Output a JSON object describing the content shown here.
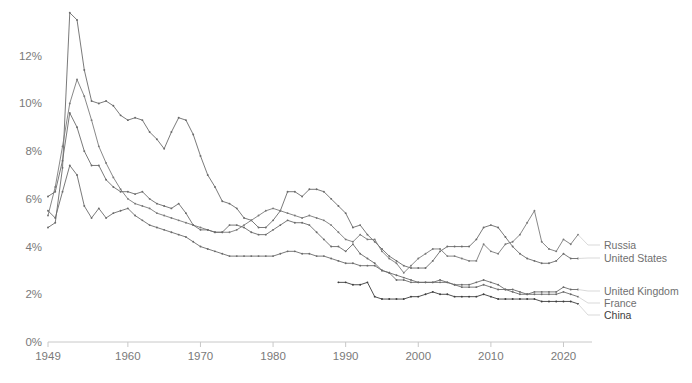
{
  "chart_data": {
    "type": "line",
    "title": "",
    "subtitle": "",
    "xlabel": "",
    "ylabel": "",
    "xlim": [
      1949,
      2022
    ],
    "ylim": [
      0,
      14
    ],
    "grid": false,
    "legend_position": "right-inline",
    "y_ticks": [
      "0%",
      "2%",
      "4%",
      "6%",
      "8%",
      "10%",
      "12%"
    ],
    "y_tick_values": [
      0,
      2,
      4,
      6,
      8,
      10,
      12
    ],
    "x_ticks": [
      "1949",
      "1960",
      "1970",
      "1980",
      "1990",
      "2000",
      "2010",
      "2020"
    ],
    "x_tick_values": [
      1949,
      1960,
      1970,
      1980,
      1990,
      2000,
      2010,
      2020
    ],
    "value_unit": "percent",
    "series": [
      {
        "name": "United States",
        "color": "#6b6b6b",
        "x": [
          1949,
          1950,
          1951,
          1952,
          1953,
          1954,
          1955,
          1956,
          1957,
          1958,
          1959,
          1960,
          1961,
          1962,
          1963,
          1964,
          1965,
          1966,
          1967,
          1968,
          1969,
          1970,
          1971,
          1972,
          1973,
          1974,
          1975,
          1976,
          1977,
          1978,
          1979,
          1980,
          1981,
          1982,
          1983,
          1984,
          1985,
          1986,
          1987,
          1988,
          1989,
          1990,
          1991,
          1992,
          1993,
          1994,
          1995,
          1996,
          1997,
          1998,
          1999,
          2000,
          2001,
          2002,
          2003,
          2004,
          2005,
          2006,
          2007,
          2008,
          2009,
          2010,
          2011,
          2012,
          2013,
          2014,
          2015,
          2016,
          2017,
          2018,
          2019,
          2020,
          2021,
          2022
        ],
        "values": [
          4.8,
          5.0,
          7.3,
          13.8,
          13.5,
          11.4,
          10.1,
          10.0,
          10.1,
          9.9,
          9.5,
          9.3,
          9.4,
          9.3,
          8.8,
          8.5,
          8.1,
          8.8,
          9.4,
          9.3,
          8.7,
          7.8,
          7.0,
          6.5,
          5.9,
          5.8,
          5.6,
          5.2,
          5.1,
          4.8,
          4.8,
          5.1,
          5.5,
          6.3,
          6.3,
          6.1,
          6.4,
          6.4,
          6.3,
          6.0,
          5.7,
          5.4,
          4.8,
          4.9,
          4.5,
          4.2,
          3.9,
          3.6,
          3.4,
          3.2,
          3.1,
          3.1,
          3.1,
          3.4,
          3.8,
          4.0,
          4.0,
          4.0,
          4.0,
          4.3,
          4.8,
          4.9,
          4.8,
          4.4,
          4.0,
          3.7,
          3.5,
          3.4,
          3.3,
          3.3,
          3.4,
          3.7,
          3.5,
          3.5
        ]
      },
      {
        "name": "Russia",
        "color": "#7a7a7a",
        "x": [
          1949,
          1950,
          1951,
          1952,
          1953,
          1954,
          1955,
          1956,
          1957,
          1958,
          1959,
          1960,
          1961,
          1962,
          1963,
          1964,
          1965,
          1966,
          1967,
          1968,
          1969,
          1970,
          1971,
          1972,
          1973,
          1974,
          1975,
          1976,
          1977,
          1978,
          1979,
          1980,
          1981,
          1982,
          1983,
          1984,
          1985,
          1986,
          1987,
          1988,
          1989,
          1990,
          1991,
          1992,
          1993,
          1994,
          1995,
          1996,
          1997,
          1998,
          1999,
          2000,
          2001,
          2002,
          2003,
          2004,
          2005,
          2006,
          2007,
          2008,
          2009,
          2010,
          2011,
          2012,
          2013,
          2014,
          2015,
          2016,
          2017,
          2018,
          2019,
          2020,
          2021,
          2022
        ],
        "values": [
          5.3,
          6.5,
          8.2,
          10.0,
          11.0,
          10.3,
          9.3,
          8.2,
          7.5,
          6.9,
          6.4,
          6.0,
          5.8,
          5.7,
          5.6,
          5.4,
          5.3,
          5.2,
          5.1,
          5.0,
          4.9,
          4.8,
          4.7,
          4.6,
          4.6,
          4.6,
          4.7,
          4.9,
          5.1,
          5.3,
          5.5,
          5.6,
          5.5,
          5.4,
          5.3,
          5.2,
          5.3,
          5.2,
          5.1,
          4.9,
          4.6,
          4.3,
          4.2,
          4.5,
          4.3,
          4.3,
          3.8,
          3.5,
          3.3,
          2.9,
          3.2,
          3.5,
          3.7,
          3.9,
          3.9,
          3.6,
          3.6,
          3.5,
          3.4,
          3.4,
          4.1,
          3.8,
          3.7,
          4.1,
          4.2,
          4.5,
          5.0,
          5.5,
          4.2,
          3.9,
          3.8,
          4.3,
          4.1,
          4.5
        ]
      },
      {
        "name": "United Kingdom",
        "color": "#6b6b6b",
        "x": [
          1949,
          1950,
          1951,
          1952,
          1953,
          1954,
          1955,
          1956,
          1957,
          1958,
          1959,
          1960,
          1961,
          1962,
          1963,
          1964,
          1965,
          1966,
          1967,
          1968,
          1969,
          1970,
          1971,
          1972,
          1973,
          1974,
          1975,
          1976,
          1977,
          1978,
          1979,
          1980,
          1981,
          1982,
          1983,
          1984,
          1985,
          1986,
          1987,
          1988,
          1989,
          1990,
          1991,
          1992,
          1993,
          1994,
          1995,
          1996,
          1997,
          1998,
          1999,
          2000,
          2001,
          2002,
          2003,
          2004,
          2005,
          2006,
          2007,
          2008,
          2009,
          2010,
          2011,
          2012,
          2013,
          2014,
          2015,
          2016,
          2017,
          2018,
          2019,
          2020,
          2021,
          2022
        ],
        "values": [
          6.1,
          6.3,
          7.6,
          9.6,
          9.0,
          8.0,
          7.4,
          7.4,
          6.8,
          6.5,
          6.3,
          6.3,
          6.2,
          6.3,
          6.0,
          5.8,
          5.7,
          5.6,
          5.8,
          5.4,
          4.9,
          4.7,
          4.7,
          4.6,
          4.6,
          4.9,
          4.9,
          4.8,
          4.6,
          4.5,
          4.5,
          4.7,
          4.9,
          5.1,
          5.0,
          5.0,
          4.9,
          4.6,
          4.3,
          4.0,
          4.0,
          3.8,
          4.1,
          3.7,
          3.5,
          3.3,
          3.0,
          2.9,
          2.6,
          2.6,
          2.5,
          2.5,
          2.5,
          2.5,
          2.6,
          2.5,
          2.4,
          2.4,
          2.4,
          2.5,
          2.6,
          2.5,
          2.4,
          2.2,
          2.2,
          2.1,
          2.0,
          2.1,
          2.1,
          2.1,
          2.1,
          2.3,
          2.2,
          2.2
        ]
      },
      {
        "name": "France",
        "color": "#6b6b6b",
        "x": [
          1949,
          1950,
          1951,
          1952,
          1953,
          1954,
          1955,
          1956,
          1957,
          1958,
          1959,
          1960,
          1961,
          1962,
          1963,
          1964,
          1965,
          1966,
          1967,
          1968,
          1969,
          1970,
          1971,
          1972,
          1973,
          1974,
          1975,
          1976,
          1977,
          1978,
          1979,
          1980,
          1981,
          1982,
          1983,
          1984,
          1985,
          1986,
          1987,
          1988,
          1989,
          1990,
          1991,
          1992,
          1993,
          1994,
          1995,
          1996,
          1997,
          1998,
          1999,
          2000,
          2001,
          2002,
          2003,
          2004,
          2005,
          2006,
          2007,
          2008,
          2009,
          2010,
          2011,
          2012,
          2013,
          2014,
          2015,
          2016,
          2017,
          2018,
          2019,
          2020,
          2021,
          2022
        ],
        "values": [
          5.5,
          5.2,
          6.3,
          7.4,
          7.0,
          5.7,
          5.2,
          5.6,
          5.2,
          5.4,
          5.5,
          5.6,
          5.3,
          5.1,
          4.9,
          4.8,
          4.7,
          4.6,
          4.5,
          4.4,
          4.2,
          4.0,
          3.9,
          3.8,
          3.7,
          3.6,
          3.6,
          3.6,
          3.6,
          3.6,
          3.6,
          3.6,
          3.7,
          3.8,
          3.8,
          3.7,
          3.7,
          3.6,
          3.6,
          3.5,
          3.4,
          3.3,
          3.3,
          3.2,
          3.2,
          3.2,
          3.0,
          2.9,
          2.8,
          2.7,
          2.6,
          2.5,
          2.5,
          2.5,
          2.5,
          2.5,
          2.4,
          2.3,
          2.3,
          2.3,
          2.4,
          2.3,
          2.2,
          2.2,
          2.1,
          2.0,
          2.0,
          2.0,
          2.0,
          2.0,
          2.0,
          2.1,
          2.0,
          1.9
        ]
      },
      {
        "name": "China",
        "color": "#3d3d3d",
        "x": [
          1989,
          1990,
          1991,
          1992,
          1993,
          1994,
          1995,
          1996,
          1997,
          1998,
          1999,
          2000,
          2001,
          2002,
          2003,
          2004,
          2005,
          2006,
          2007,
          2008,
          2009,
          2010,
          2011,
          2012,
          2013,
          2014,
          2015,
          2016,
          2017,
          2018,
          2019,
          2020,
          2021,
          2022
        ],
        "values": [
          2.5,
          2.5,
          2.4,
          2.4,
          2.5,
          1.9,
          1.8,
          1.8,
          1.8,
          1.8,
          1.9,
          1.9,
          2.0,
          2.1,
          2.0,
          2.0,
          1.9,
          1.9,
          1.9,
          1.9,
          2.0,
          1.9,
          1.8,
          1.8,
          1.8,
          1.8,
          1.8,
          1.8,
          1.7,
          1.7,
          1.7,
          1.7,
          1.7,
          1.6
        ]
      }
    ]
  },
  "legend": [
    {
      "label": "Russia",
      "series": "Russia",
      "emphasis": false
    },
    {
      "label": "United States",
      "series": "United States",
      "emphasis": false
    },
    {
      "label": "United Kingdom",
      "series": "United Kingdom",
      "emphasis": false
    },
    {
      "label": "France",
      "series": "France",
      "emphasis": false
    },
    {
      "label": "China",
      "series": "China",
      "emphasis": true
    }
  ],
  "colors": {
    "background": "#ffffff",
    "axis": "#c8c8c8",
    "tick_text": "#7a7a7a",
    "line_default": "#6b6b6b",
    "line_emphasis": "#3d3d3d",
    "leader": "#cfcfcf"
  }
}
